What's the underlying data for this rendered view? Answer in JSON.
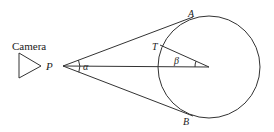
{
  "diagram": {
    "labels": {
      "camera": "Camera",
      "P": "P",
      "A": "A",
      "B": "B",
      "T": "T",
      "alpha": "α",
      "beta": "β"
    },
    "geometry": {
      "point_P": [
        63,
        66
      ],
      "circle_center": [
        209,
        67
      ],
      "circle_radius": 51,
      "tangent_point_A": [
        190,
        19
      ],
      "tangent_point_B": [
        190,
        115
      ],
      "point_T": [
        157,
        46
      ],
      "camera_triangle": [
        [
          19,
          53
        ],
        [
          19,
          78
        ],
        [
          41,
          66
        ]
      ]
    },
    "colors": {
      "line": "#333333",
      "text": "#222222",
      "background": "#ffffff"
    }
  }
}
